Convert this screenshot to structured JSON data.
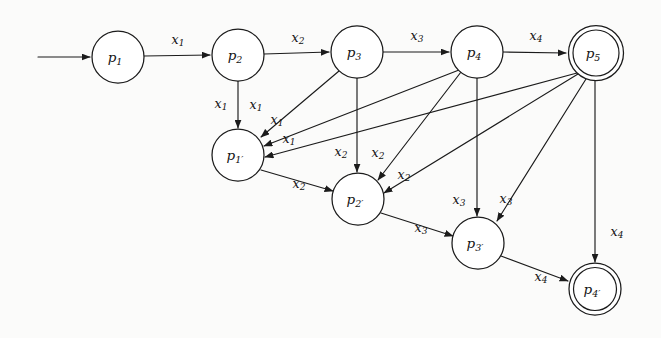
{
  "figure": {
    "type": "finite-state-automaton-diagram",
    "background_color": "#fbfbfa",
    "ink_color": "#1b1b1b",
    "width": 661,
    "height": 338
  },
  "alphabet": [
    "x1",
    "x2",
    "x3",
    "x4"
  ],
  "start_state": "p1",
  "accepting_states": [
    "p5",
    "p4'"
  ],
  "states": [
    {
      "id": "p1",
      "base": "p",
      "sub": "1",
      "cx": 118,
      "cy": 57,
      "r": 26,
      "accepting": false
    },
    {
      "id": "p2",
      "base": "p",
      "sub": "2",
      "cx": 238,
      "cy": 55,
      "r": 26,
      "accepting": false
    },
    {
      "id": "p3",
      "base": "p",
      "sub": "3",
      "cx": 357,
      "cy": 52,
      "r": 26,
      "accepting": false
    },
    {
      "id": "p4",
      "base": "p",
      "sub": "4",
      "cx": 477,
      "cy": 52,
      "r": 26,
      "accepting": false
    },
    {
      "id": "p5",
      "base": "p",
      "sub": "5",
      "cx": 596,
      "cy": 53,
      "r": 27.5,
      "accepting": true,
      "r_inner": 23
    },
    {
      "id": "p1p",
      "base": "p",
      "sub": "1′",
      "cx": 238,
      "cy": 155,
      "r": 26,
      "accepting": false
    },
    {
      "id": "p2p",
      "base": "p",
      "sub": "2′",
      "cx": 358,
      "cy": 199,
      "r": 26,
      "accepting": false
    },
    {
      "id": "p3p",
      "base": "p",
      "sub": "3′",
      "cx": 478,
      "cy": 243,
      "r": 26,
      "accepting": false
    },
    {
      "id": "p4p",
      "base": "p",
      "sub": "4′",
      "cx": 595,
      "cy": 289,
      "r": 26,
      "accepting": true,
      "r_inner": 21.5
    }
  ],
  "start_arrow": {
    "x1": 38,
    "y1": 57,
    "x2": 90,
    "y2": 57
  },
  "transitions": [
    {
      "from": "p1",
      "to": "p2",
      "symbol": "x",
      "sub": "1",
      "label_x": 178,
      "label_y": 40
    },
    {
      "from": "p2",
      "to": "p3",
      "symbol": "x",
      "sub": "2",
      "label_x": 298,
      "label_y": 38
    },
    {
      "from": "p3",
      "to": "p4",
      "symbol": "x",
      "sub": "3",
      "label_x": 417,
      "label_y": 36
    },
    {
      "from": "p4",
      "to": "p5",
      "symbol": "x",
      "sub": "4",
      "label_x": 536,
      "label_y": 36
    },
    {
      "from": "p2",
      "to": "p1p",
      "symbol": "x",
      "sub": "1",
      "label_x": 221,
      "label_y": 104
    },
    {
      "from": "p3",
      "to": "p1p",
      "symbol": "x",
      "sub": "1",
      "label_x": 256,
      "label_y": 105
    },
    {
      "from": "p4",
      "to": "p1p",
      "symbol": "x",
      "sub": "1",
      "label_x": 277,
      "label_y": 120
    },
    {
      "from": "p5",
      "to": "p1p",
      "symbol": "x",
      "sub": "1",
      "label_x": 289,
      "label_y": 139
    },
    {
      "from": "p1p",
      "to": "p2p",
      "symbol": "x",
      "sub": "2",
      "label_x": 299,
      "label_y": 184
    },
    {
      "from": "p3",
      "to": "p2p",
      "symbol": "x",
      "sub": "2",
      "label_x": 341,
      "label_y": 152
    },
    {
      "from": "p4",
      "to": "p2p",
      "symbol": "x",
      "sub": "2",
      "label_x": 378,
      "label_y": 153
    },
    {
      "from": "p5",
      "to": "p2p",
      "symbol": "x",
      "sub": "2",
      "label_x": 404,
      "label_y": 175
    },
    {
      "from": "p2p",
      "to": "p3p",
      "symbol": "x",
      "sub": "3",
      "label_x": 421,
      "label_y": 228
    },
    {
      "from": "p4",
      "to": "p3p",
      "symbol": "x",
      "sub": "3",
      "label_x": 459,
      "label_y": 200
    },
    {
      "from": "p5",
      "to": "p3p",
      "symbol": "x",
      "sub": "3",
      "label_x": 506,
      "label_y": 199
    },
    {
      "from": "p3p",
      "to": "p4p",
      "symbol": "x",
      "sub": "4",
      "label_x": 541,
      "label_y": 277
    },
    {
      "from": "p5",
      "to": "p4p",
      "symbol": "x",
      "sub": "4",
      "label_x": 617,
      "label_y": 232
    }
  ],
  "edge_geometry": {
    "p1-p2": {
      "x1": 144,
      "y1": 56,
      "x2": 210,
      "y2": 55
    },
    "p2-p3": {
      "x1": 264,
      "y1": 54,
      "x2": 329,
      "y2": 52
    },
    "p3-p4": {
      "x1": 383,
      "y1": 52,
      "x2": 449,
      "y2": 52
    },
    "p4-p5": {
      "x1": 503,
      "y1": 52,
      "x2": 566,
      "y2": 53
    },
    "p2-p1p": {
      "x1": 238,
      "y1": 81,
      "x2": 238,
      "y2": 128
    },
    "p3-p1p": {
      "x1": 339,
      "y1": 71,
      "x2": 261,
      "y2": 137
    },
    "p4-p1p": {
      "x1": 459,
      "y1": 70,
      "x2": 264,
      "y2": 146
    },
    "p5-p1p": {
      "x1": 577,
      "y1": 73,
      "x2": 265,
      "y2": 157
    },
    "p1p-p2p": {
      "x1": 261,
      "y1": 170,
      "x2": 333,
      "y2": 191
    },
    "p3-p2p": {
      "x1": 357,
      "y1": 78,
      "x2": 357,
      "y2": 172
    },
    "p4-p2p": {
      "x1": 461,
      "y1": 72,
      "x2": 378,
      "y2": 180
    },
    "p5-p2p": {
      "x1": 578,
      "y1": 74,
      "x2": 384,
      "y2": 193
    },
    "p2p-p3p": {
      "x1": 381,
      "y1": 213,
      "x2": 453,
      "y2": 236
    },
    "p4-p3p": {
      "x1": 477,
      "y1": 78,
      "x2": 477,
      "y2": 216
    },
    "p5-p3p": {
      "x1": 586,
      "y1": 79,
      "x2": 497,
      "y2": 221
    },
    "p3p-p4p": {
      "x1": 501,
      "y1": 256,
      "x2": 568,
      "y2": 281
    },
    "p5-p4p": {
      "x1": 595,
      "y1": 81,
      "x2": 595,
      "y2": 262
    }
  }
}
